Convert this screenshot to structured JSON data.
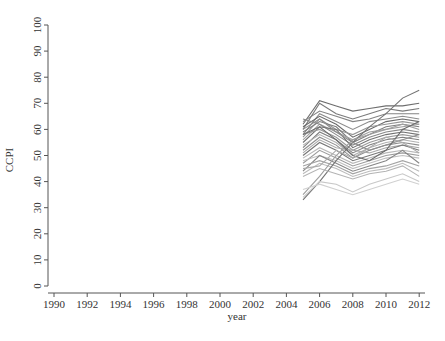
{
  "chart_data": {
    "type": "line",
    "title": "",
    "xlabel": "year",
    "ylabel": "CCPI",
    "xlim": [
      1990,
      2012
    ],
    "ylim": [
      0,
      100
    ],
    "grid": false,
    "legend": "none",
    "x_ticks": [
      "1990",
      "1992",
      "1994",
      "1996",
      "1998",
      "2000",
      "2002",
      "2004",
      "2006",
      "2008",
      "2010",
      "2012"
    ],
    "y_ticks": [
      "0",
      "10",
      "20",
      "30",
      "40",
      "50",
      "60",
      "70",
      "80",
      "90",
      "100"
    ],
    "x": [
      2005,
      2006,
      2007,
      2008,
      2009,
      2010,
      2011,
      2012
    ],
    "series": [
      {
        "name": "s1",
        "color": "#6e6e6e",
        "values": [
          62,
          71,
          69,
          67,
          68,
          69,
          69,
          70
        ]
      },
      {
        "name": "s2",
        "color": "#7a7a7a",
        "values": [
          60,
          70,
          66,
          64,
          66,
          68,
          67,
          68
        ]
      },
      {
        "name": "s3",
        "color": "#848484",
        "values": [
          63,
          67,
          65,
          63,
          64,
          66,
          66,
          66
        ]
      },
      {
        "name": "s4",
        "color": "#8c8c8c",
        "values": [
          58,
          66,
          63,
          60,
          63,
          64,
          65,
          64
        ]
      },
      {
        "name": "s5",
        "color": "#6a6a6a",
        "values": [
          61,
          65,
          62,
          57,
          60,
          63,
          64,
          63
        ]
      },
      {
        "name": "s6",
        "color": "#969696",
        "values": [
          57,
          64,
          60,
          58,
          61,
          62,
          63,
          62
        ]
      },
      {
        "name": "s7",
        "color": "#7e7e7e",
        "values": [
          59,
          63,
          61,
          55,
          58,
          61,
          62,
          61
        ]
      },
      {
        "name": "s8",
        "color": "#a0a0a0",
        "values": [
          56,
          62,
          59,
          56,
          59,
          60,
          62,
          60
        ]
      },
      {
        "name": "s9",
        "color": "#888888",
        "values": [
          64,
          62,
          58,
          54,
          57,
          59,
          60,
          59
        ]
      },
      {
        "name": "s10",
        "color": "#727272",
        "values": [
          55,
          61,
          60,
          53,
          56,
          58,
          59,
          58
        ]
      },
      {
        "name": "s11",
        "color": "#9a9a9a",
        "values": [
          58,
          60,
          57,
          52,
          55,
          57,
          58,
          57
        ]
      },
      {
        "name": "s12",
        "color": "#808080",
        "values": [
          53,
          59,
          56,
          51,
          54,
          56,
          57,
          56
        ]
      },
      {
        "name": "s13",
        "color": "#b0b0b0",
        "values": [
          54,
          58,
          55,
          50,
          53,
          55,
          56,
          55
        ]
      },
      {
        "name": "s14",
        "color": "#909090",
        "values": [
          52,
          57,
          54,
          49,
          52,
          54,
          55,
          54
        ]
      },
      {
        "name": "s15",
        "color": "#a8a8a8",
        "values": [
          51,
          56,
          53,
          52,
          51,
          53,
          54,
          53
        ]
      },
      {
        "name": "s16",
        "color": "#787878",
        "values": [
          50,
          55,
          52,
          48,
          50,
          52,
          54,
          52
        ]
      },
      {
        "name": "s17",
        "color": "#b8b8b8",
        "values": [
          49,
          53,
          50,
          47,
          49,
          51,
          52,
          51
        ]
      },
      {
        "name": "s18",
        "color": "#9c9c9c",
        "values": [
          47,
          52,
          49,
          46,
          48,
          50,
          51,
          50
        ]
      },
      {
        "name": "s19",
        "color": "#c0c0c0",
        "values": [
          48,
          50,
          48,
          45,
          47,
          49,
          50,
          49
        ]
      },
      {
        "name": "s20",
        "color": "#868686",
        "values": [
          44,
          50,
          47,
          44,
          46,
          48,
          52,
          47
        ]
      },
      {
        "name": "s21",
        "color": "#a4a4a4",
        "values": [
          46,
          48,
          46,
          43,
          45,
          46,
          48,
          46
        ]
      },
      {
        "name": "s22",
        "color": "#bcbcbc",
        "values": [
          43,
          47,
          45,
          42,
          44,
          45,
          47,
          44
        ]
      },
      {
        "name": "s23",
        "color": "#747474",
        "values": [
          33,
          40,
          48,
          55,
          61,
          66,
          72,
          75
        ]
      },
      {
        "name": "s24",
        "color": "#9e9e9e",
        "values": [
          35,
          42,
          50,
          56,
          58,
          60,
          61,
          62
        ]
      },
      {
        "name": "s25",
        "color": "#c8c8c8",
        "values": [
          34,
          40,
          39,
          36,
          39,
          41,
          43,
          40
        ]
      },
      {
        "name": "s26",
        "color": "#d0d0d0",
        "values": [
          37,
          39,
          37,
          35,
          37,
          39,
          41,
          39
        ]
      },
      {
        "name": "s27",
        "color": "#b4b4b4",
        "values": [
          42,
          45,
          43,
          41,
          43,
          44,
          46,
          42
        ]
      },
      {
        "name": "s28",
        "color": "#8e8e8e",
        "values": [
          60,
          64,
          59,
          55,
          52,
          54,
          56,
          58
        ]
      },
      {
        "name": "s29",
        "color": "#6c6c6c",
        "values": [
          58,
          61,
          56,
          50,
          48,
          52,
          60,
          63
        ]
      },
      {
        "name": "s30",
        "color": "#acacac",
        "values": [
          45,
          46,
          52,
          49,
          53,
          57,
          55,
          51
        ]
      }
    ]
  }
}
